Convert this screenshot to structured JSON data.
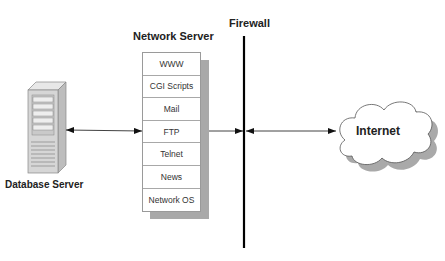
{
  "network_server": {
    "title": "Network Server",
    "services": [
      "WWW",
      "CGI Scripts",
      "Mail",
      "FTP",
      "Telnet",
      "News",
      "Network OS"
    ]
  },
  "firewall": {
    "label": "Firewall"
  },
  "database_server": {
    "label": "Database Server"
  },
  "internet": {
    "label": "Internet"
  },
  "colors": {
    "shadow": "#a9a9a9",
    "line": "#000000",
    "text": "#222222"
  }
}
